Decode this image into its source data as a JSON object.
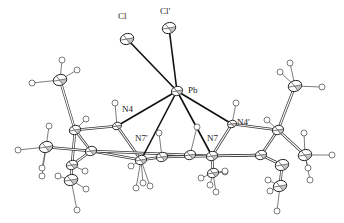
{
  "diagram": {
    "type": "ortep-molecular-structure",
    "central_atom": "Pb",
    "labels": [
      {
        "id": "Cl",
        "text": "Cl",
        "x": 118,
        "y": 19
      },
      {
        "id": "Cl2",
        "text": "Cl′",
        "x": 160,
        "y": 14
      },
      {
        "id": "Pb",
        "text": "Pb",
        "x": 188,
        "y": 93
      },
      {
        "id": "N4",
        "text": "N4",
        "x": 122,
        "y": 112
      },
      {
        "id": "N7p",
        "text": "N7′",
        "x": 135,
        "y": 141
      },
      {
        "id": "N7",
        "text": "N7",
        "x": 207,
        "y": 141
      },
      {
        "id": "N4p",
        "text": "N4′",
        "x": 237,
        "y": 125
      }
    ],
    "atoms": [
      {
        "id": "Pb",
        "x": 177,
        "y": 91,
        "r": 5,
        "kind": "heavy"
      },
      {
        "id": "Cl",
        "x": 127,
        "y": 39,
        "r": 6,
        "kind": "heavy"
      },
      {
        "id": "Cl2",
        "x": 169,
        "y": 28,
        "r": 6,
        "kind": "heavy"
      },
      {
        "id": "N4",
        "x": 117,
        "y": 126,
        "r": 4,
        "kind": "heavy"
      },
      {
        "id": "N7p",
        "x": 141,
        "y": 160,
        "r": 5,
        "kind": "heavy"
      },
      {
        "id": "N7",
        "x": 212,
        "y": 156,
        "r": 5,
        "kind": "heavy"
      },
      {
        "id": "N4p",
        "x": 232,
        "y": 124,
        "r": 4,
        "kind": "heavy"
      },
      {
        "id": "C1",
        "x": 75,
        "y": 130,
        "r": 5,
        "kind": "heavy"
      },
      {
        "id": "C2",
        "x": 60,
        "y": 80,
        "r": 6,
        "kind": "heavy"
      },
      {
        "id": "C3",
        "x": 46,
        "y": 147,
        "r": 6,
        "kind": "heavy"
      },
      {
        "id": "C4",
        "x": 91,
        "y": 151,
        "r": 5,
        "kind": "heavy"
      },
      {
        "id": "C5",
        "x": 72,
        "y": 165,
        "r": 5,
        "kind": "heavy"
      },
      {
        "id": "C6",
        "x": 71,
        "y": 180,
        "r": 6,
        "kind": "heavy"
      },
      {
        "id": "C7",
        "x": 162,
        "y": 157,
        "r": 5,
        "kind": "heavy"
      },
      {
        "id": "C8",
        "x": 190,
        "y": 155,
        "r": 5,
        "kind": "heavy"
      },
      {
        "id": "C9",
        "x": 213,
        "y": 173,
        "r": 5,
        "kind": "heavy"
      },
      {
        "id": "C10",
        "x": 278,
        "y": 130,
        "r": 5,
        "kind": "heavy"
      },
      {
        "id": "C11",
        "x": 295,
        "y": 86,
        "r": 6,
        "kind": "heavy"
      },
      {
        "id": "C12",
        "x": 261,
        "y": 155,
        "r": 5,
        "kind": "heavy"
      },
      {
        "id": "C13",
        "x": 305,
        "y": 155,
        "r": 6,
        "kind": "heavy"
      },
      {
        "id": "C14",
        "x": 282,
        "y": 165,
        "r": 6,
        "kind": "heavy"
      },
      {
        "id": "C15",
        "x": 280,
        "y": 186,
        "r": 6,
        "kind": "heavy"
      }
    ],
    "bonds_coordination": [
      [
        "Pb",
        "Cl"
      ],
      [
        "Pb",
        "Cl2"
      ],
      [
        "Pb",
        "N4"
      ],
      [
        "Pb",
        "N7p"
      ],
      [
        "Pb",
        "N7"
      ],
      [
        "Pb",
        "N4p"
      ]
    ],
    "bonds_organic": [
      [
        "N4",
        "C1"
      ],
      [
        "C1",
        "C2"
      ],
      [
        "C1",
        "C4"
      ],
      [
        "C1",
        "C5"
      ],
      [
        "C4",
        "C5"
      ],
      [
        "C5",
        "C6"
      ],
      [
        "C3",
        "C4"
      ],
      [
        "N4",
        "N7p"
      ],
      [
        "N7p",
        "C4"
      ],
      [
        "N7p",
        "C7"
      ],
      [
        "C7",
        "C8"
      ],
      [
        "C8",
        "N7"
      ],
      [
        "N7",
        "C9"
      ],
      [
        "N7",
        "C12"
      ],
      [
        "N4p",
        "C10"
      ],
      [
        "C10",
        "C11"
      ],
      [
        "C10",
        "C12"
      ],
      [
        "C10",
        "C13"
      ],
      [
        "C12",
        "C14"
      ],
      [
        "C14",
        "C15"
      ],
      [
        "N4p",
        "N7"
      ],
      [
        "C4",
        "C8"
      ],
      [
        "C7",
        "C12"
      ]
    ],
    "hydrogens": [
      {
        "x": 62,
        "y": 60
      },
      {
        "x": 77,
        "y": 70
      },
      {
        "x": 32,
        "y": 83
      },
      {
        "x": 115,
        "y": 103
      },
      {
        "x": 86,
        "y": 119
      },
      {
        "x": 49,
        "y": 126
      },
      {
        "x": 18,
        "y": 150
      },
      {
        "x": 42,
        "y": 168
      },
      {
        "x": 42,
        "y": 176
      },
      {
        "x": 58,
        "y": 176
      },
      {
        "x": 85,
        "y": 171
      },
      {
        "x": 86,
        "y": 189
      },
      {
        "x": 77,
        "y": 210
      },
      {
        "x": 159,
        "y": 133
      },
      {
        "x": 131,
        "y": 166
      },
      {
        "x": 143,
        "y": 183
      },
      {
        "x": 150,
        "y": 186
      },
      {
        "x": 136,
        "y": 188
      },
      {
        "x": 197,
        "y": 127
      },
      {
        "x": 201,
        "y": 178
      },
      {
        "x": 210,
        "y": 185
      },
      {
        "x": 225,
        "y": 172
      },
      {
        "x": 216,
        "y": 192
      },
      {
        "x": 236,
        "y": 103
      },
      {
        "x": 267,
        "y": 120
      },
      {
        "x": 290,
        "y": 63
      },
      {
        "x": 280,
        "y": 72
      },
      {
        "x": 322,
        "y": 87
      },
      {
        "x": 304,
        "y": 133
      },
      {
        "x": 332,
        "y": 155
      },
      {
        "x": 308,
        "y": 168
      },
      {
        "x": 310,
        "y": 180
      },
      {
        "x": 268,
        "y": 180
      },
      {
        "x": 270,
        "y": 191
      },
      {
        "x": 277,
        "y": 211
      },
      {
        "x": 225,
        "y": 171
      }
    ]
  }
}
